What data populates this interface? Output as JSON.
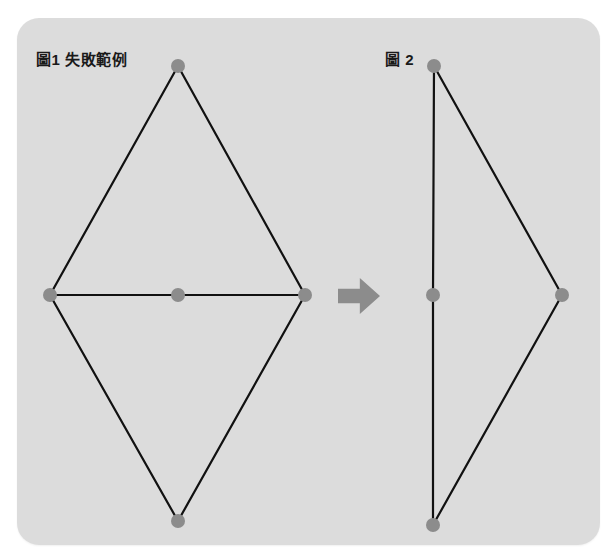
{
  "canvas": {
    "width": 615,
    "height": 560,
    "background": "#ffffff"
  },
  "panel": {
    "x": 17,
    "y": 18,
    "width": 583,
    "height": 527,
    "fill": "#dcdcdc",
    "corner_radius": 22
  },
  "style": {
    "node_fill": "#8c8c8c",
    "node_radius": 7,
    "edge_color": "#111111",
    "edge_width": 2.2,
    "arrow_fill": "#8c8c8c",
    "label_color": "#1a1a1a"
  },
  "figures": [
    {
      "id": "figure-1",
      "label": "圖1 失敗範例",
      "label_x": 36,
      "label_y": 52,
      "nodes": [
        {
          "name": "node-top",
          "x": 178,
          "y": 66
        },
        {
          "name": "node-left",
          "x": 50,
          "y": 295
        },
        {
          "name": "node-center",
          "x": 178,
          "y": 295
        },
        {
          "name": "node-right",
          "x": 305,
          "y": 295
        },
        {
          "name": "node-bottom",
          "x": 178,
          "y": 521
        }
      ],
      "edges": [
        {
          "name": "edge-top-left",
          "from": 0,
          "to": 1
        },
        {
          "name": "edge-top-right",
          "from": 0,
          "to": 3
        },
        {
          "name": "edge-left-center",
          "from": 1,
          "to": 2
        },
        {
          "name": "edge-center-right",
          "from": 2,
          "to": 3
        },
        {
          "name": "edge-left-bottom",
          "from": 1,
          "to": 4
        },
        {
          "name": "edge-right-bottom",
          "from": 3,
          "to": 4
        }
      ]
    },
    {
      "id": "figure-2",
      "label": "圖 2",
      "label_x": 385,
      "label_y": 52,
      "nodes": [
        {
          "name": "node-top",
          "x": 434,
          "y": 66
        },
        {
          "name": "node-middle",
          "x": 433,
          "y": 295
        },
        {
          "name": "node-right",
          "x": 562,
          "y": 295
        },
        {
          "name": "node-bottom",
          "x": 433,
          "y": 525
        }
      ],
      "edges": [
        {
          "name": "edge-top-middle",
          "from": 0,
          "to": 1
        },
        {
          "name": "edge-middle-bottom",
          "from": 1,
          "to": 3
        },
        {
          "name": "edge-top-right",
          "from": 0,
          "to": 2
        },
        {
          "name": "edge-right-bottom",
          "from": 2,
          "to": 3
        }
      ]
    }
  ],
  "arrow": {
    "name": "transform-arrow",
    "x": 338,
    "y": 278,
    "width": 42,
    "height": 36,
    "direction": "right"
  }
}
